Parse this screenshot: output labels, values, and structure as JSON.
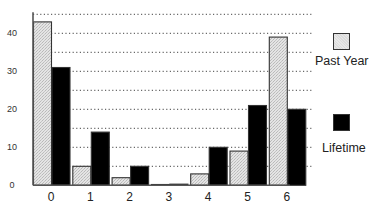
{
  "chart_data": {
    "type": "bar",
    "title": "",
    "xlabel": "",
    "ylabel": "",
    "categories": [
      "0",
      "1",
      "2",
      "3",
      "4",
      "5",
      "6"
    ],
    "series": [
      {
        "name": "Past Year",
        "values": [
          43,
          5,
          2,
          0,
          3,
          9,
          39
        ],
        "color": "#d9d9d9",
        "pattern": "light-stipple"
      },
      {
        "name": "Lifetime",
        "values": [
          31,
          14,
          5,
          0.3,
          10,
          21,
          20
        ],
        "color": "#000000",
        "pattern": "solid"
      }
    ],
    "ylim": [
      0,
      45
    ],
    "yticks": [
      0,
      10,
      20,
      30,
      40
    ],
    "grid": {
      "y": true,
      "style": "dotted",
      "interval": 5
    },
    "legend": {
      "position": "right"
    }
  },
  "legend": {
    "items": [
      {
        "label": "Past Year"
      },
      {
        "label": "Lifetime"
      }
    ]
  }
}
